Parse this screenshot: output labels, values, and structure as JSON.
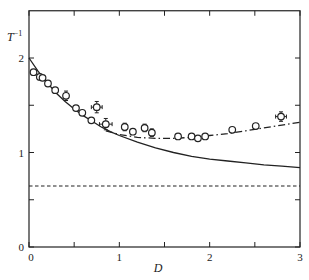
{
  "chart_data": {
    "type": "scatter",
    "title": "",
    "xlabel": "D",
    "ylabel": "T⁻¹",
    "xlim": [
      0,
      3
    ],
    "ylim": [
      0,
      2.5
    ],
    "x_ticks": [
      0,
      1,
      2,
      3
    ],
    "x_minor_ticks": [
      0.5,
      1.5,
      2.5
    ],
    "y_ticks": [
      0,
      1,
      2
    ],
    "y_minor_ticks": [
      0.5,
      1.5
    ],
    "grid": false,
    "legend": null,
    "series": [
      {
        "name": "data",
        "kind": "scatter",
        "marker": "open-circle",
        "x": [
          0.05,
          0.12,
          0.15,
          0.21,
          0.29,
          0.41,
          0.52,
          0.59,
          0.69,
          0.75,
          0.85,
          1.06,
          1.15,
          1.28,
          1.36,
          1.65,
          1.8,
          1.87,
          1.95,
          2.25,
          2.51,
          2.79
        ],
        "y": [
          1.85,
          1.8,
          1.79,
          1.73,
          1.66,
          1.6,
          1.47,
          1.42,
          1.34,
          1.48,
          1.3,
          1.27,
          1.22,
          1.26,
          1.21,
          1.17,
          1.17,
          1.15,
          1.17,
          1.24,
          1.28,
          1.38
        ],
        "xerr": [
          0,
          0,
          0,
          0,
          0,
          0,
          0,
          0,
          0,
          0.06,
          0.07,
          0,
          0,
          0,
          0,
          0,
          0,
          0,
          0,
          0,
          0,
          0.06
        ],
        "yerr": [
          0,
          0,
          0,
          0,
          0,
          0.05,
          0,
          0,
          0,
          0.06,
          0.06,
          0.04,
          0,
          0.04,
          0.04,
          0,
          0,
          0,
          0,
          0,
          0,
          0.05
        ]
      },
      {
        "name": "theory-solid",
        "kind": "line",
        "style": "solid",
        "x": [
          0,
          0.1,
          0.2,
          0.3,
          0.4,
          0.5,
          0.6,
          0.7,
          0.8,
          0.9,
          1.0,
          1.2,
          1.4,
          1.6,
          1.8,
          2.0,
          2.2,
          2.4,
          2.6,
          2.8,
          3.0
        ],
        "y": [
          2.0,
          1.86,
          1.74,
          1.63,
          1.54,
          1.46,
          1.39,
          1.33,
          1.27,
          1.22,
          1.18,
          1.11,
          1.05,
          1.0,
          0.96,
          0.93,
          0.91,
          0.89,
          0.87,
          0.855,
          0.84
        ]
      },
      {
        "name": "theory-dashdot",
        "kind": "line",
        "style": "dash-dot",
        "x": [
          0.85,
          1.0,
          1.2,
          1.4,
          1.6,
          1.8,
          2.0,
          2.2,
          2.4,
          2.6,
          2.8,
          3.0
        ],
        "y": [
          1.23,
          1.19,
          1.16,
          1.15,
          1.15,
          1.16,
          1.18,
          1.2,
          1.23,
          1.26,
          1.29,
          1.32
        ]
      },
      {
        "name": "asymptote-dashed",
        "kind": "hline",
        "style": "dashed",
        "y": 0.645
      }
    ]
  },
  "axes": {
    "x_title": "D",
    "y_title_base": "T",
    "y_title_sup": "−1",
    "x_tick_labels": [
      "0",
      "1",
      "2",
      "3"
    ],
    "y_tick_labels": [
      "0",
      "1",
      "2"
    ]
  },
  "colors": {
    "ink": "#222222",
    "background": "#ffffff"
  }
}
